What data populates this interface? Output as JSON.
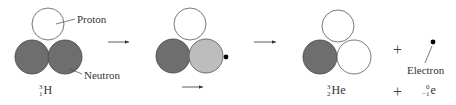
{
  "diagram": {
    "colors": {
      "proton_fill": "#ffffff",
      "neutron_fill": "#6e6e6e",
      "decaying_neutron_fill": "#bdbdbd",
      "electron_fill": "#000000",
      "stroke": "#555555"
    },
    "labels": {
      "proton": "Proton",
      "neutron": "Neutron",
      "electron": "Electron"
    },
    "stages": [
      {
        "name": "tritium",
        "nuclide": {
          "mass": "3",
          "atomic": "1",
          "symbol": "H"
        },
        "particles": [
          "proton",
          "neutron",
          "neutron"
        ]
      },
      {
        "name": "decaying",
        "particles": [
          "proton",
          "neutron",
          "decaying-neutron",
          "electron"
        ]
      },
      {
        "name": "helium-3",
        "nuclide": {
          "mass": "3",
          "atomic": "2",
          "symbol": "He"
        },
        "particles": [
          "proton",
          "neutron",
          "proton"
        ]
      }
    ],
    "products": {
      "plus": "+",
      "electron_symbol": {
        "mass": "0",
        "atomic": "−1",
        "symbol": "e"
      }
    }
  }
}
